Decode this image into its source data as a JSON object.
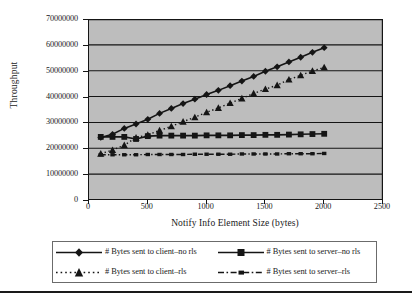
{
  "chart_data": {
    "type": "line",
    "title": "",
    "xlabel": "Notify Info Element Size (bytes)",
    "ylabel": "Throughput",
    "xlim": [
      0,
      2500
    ],
    "ylim": [
      0,
      70000000
    ],
    "xticks": [
      0,
      500,
      1000,
      1500,
      2000,
      2500
    ],
    "yticks": [
      0,
      10000000,
      20000000,
      30000000,
      40000000,
      50000000,
      60000000,
      70000000
    ],
    "xtick_labels": [
      "0",
      "500",
      "1000",
      "1500",
      "2000",
      "2500"
    ],
    "ytick_labels": [
      "0",
      "10000000",
      "20000000",
      "30000000",
      "40000000",
      "50000000",
      "60000000",
      "70000000"
    ],
    "grid": "horizontal",
    "legend_position": "bottom",
    "plot_background": "#bdbdbd",
    "line_color": "#151515",
    "x": [
      100,
      200,
      300,
      400,
      500,
      600,
      700,
      800,
      900,
      1000,
      1100,
      1200,
      1300,
      1400,
      1500,
      1600,
      1700,
      1800,
      1900,
      2000
    ],
    "series": [
      {
        "name": "# Bytes sent to client-no rls",
        "marker": "diamond",
        "line_style": "solid",
        "values": [
          24200000,
          25400000,
          27700000,
          29400000,
          31200000,
          33500000,
          35400000,
          37300000,
          39000000,
          40800000,
          42400000,
          44200000,
          46000000,
          47800000,
          49800000,
          51500000,
          53400000,
          55200000,
          57100000,
          58900000
        ]
      },
      {
        "name": "# Bytes sent to server-no rls",
        "marker": "square",
        "line_style": "solid",
        "values": [
          24400000,
          24400000,
          24400000,
          23600000,
          24700000,
          24900000,
          24900000,
          24900000,
          24900000,
          25000000,
          25000000,
          25000000,
          25100000,
          25100000,
          25200000,
          25200000,
          25300000,
          25400000,
          25500000,
          25600000
        ]
      },
      {
        "name": "# Bytes sent to client-rls",
        "marker": "triangle",
        "line_style": "dotted",
        "values": [
          17900000,
          19300000,
          21200000,
          24100000,
          25200000,
          26900000,
          28500000,
          30300000,
          32000000,
          33900000,
          35600000,
          37500000,
          39300000,
          41200000,
          42900000,
          44400000,
          46600000,
          48200000,
          49900000,
          51300000
        ]
      },
      {
        "name": "# Bytes sent to server-rls",
        "marker": "small-square",
        "line_style": "dash-dot",
        "values": [
          17500000,
          17500000,
          17500000,
          17500000,
          17600000,
          17600000,
          17600000,
          17600000,
          17700000,
          17700000,
          17700000,
          17700000,
          17800000,
          17800000,
          17800000,
          17800000,
          17900000,
          17900000,
          17900000,
          18000000
        ]
      }
    ]
  },
  "legend": {
    "entries": [
      {
        "label": "# Bytes sent to client–no rls",
        "marker": "diamond",
        "style": "solid"
      },
      {
        "label": "# Bytes sent to server–no rls",
        "marker": "square",
        "style": "solid"
      },
      {
        "label": "# Bytes sent to client–rls",
        "marker": "triangle",
        "style": "dotted"
      },
      {
        "label": "# Bytes sent to server–rls",
        "marker": "small-square",
        "style": "dash-dot"
      }
    ]
  }
}
